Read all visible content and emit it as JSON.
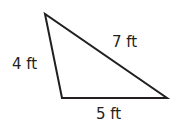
{
  "diagram": {
    "shape": "triangle",
    "vertices": [
      [
        45,
        14
      ],
      [
        62,
        98
      ],
      [
        167,
        98
      ]
    ],
    "stroke_color": "#231f20",
    "sides": [
      {
        "name": "left",
        "label": "4 ft",
        "length": 4,
        "unit": "ft"
      },
      {
        "name": "hypotenuse",
        "label": "7 ft",
        "length": 7,
        "unit": "ft"
      },
      {
        "name": "bottom",
        "label": "5 ft",
        "length": 5,
        "unit": "ft"
      }
    ]
  }
}
